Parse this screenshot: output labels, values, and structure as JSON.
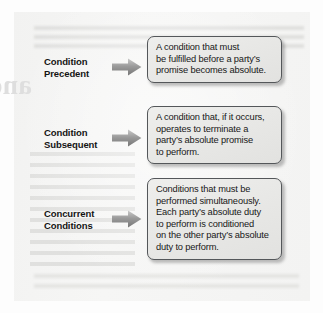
{
  "figure": {
    "type": "concept-diagram",
    "rows": [
      {
        "label_line1": "Condition",
        "label_line2": "Precedent",
        "arrow_icon": "right-arrow-icon",
        "definition_lines": [
          "A condition that must",
          "be fulfilled before a party’s",
          "promise becomes absolute."
        ]
      },
      {
        "label_line1": "Condition",
        "label_line2": "Subsequent",
        "arrow_icon": "right-arrow-icon",
        "definition_lines": [
          "A condition that, if it occurs,",
          "operates to terminate a",
          "party’s absolute promise",
          "to perform."
        ]
      },
      {
        "label_line1": "Concurrent",
        "label_line2": "Conditions",
        "arrow_icon": "right-arrow-icon",
        "definition_lines": [
          "Conditions that must be",
          "performed simultaneously.",
          "Each party’s absolute duty",
          "to perform is conditioned",
          "on the other party’s absolute",
          "duty to perform."
        ]
      }
    ]
  },
  "background": {
    "ghost_heading": "and Disc"
  },
  "colors": {
    "page": "#fdfdfd",
    "panel": "#f4f4f3",
    "callout_fill": "#e9e9e7",
    "callout_border": "#54575a",
    "label_text": "#141414",
    "body_text": "#181818",
    "arrow": "#8d8d8d"
  }
}
